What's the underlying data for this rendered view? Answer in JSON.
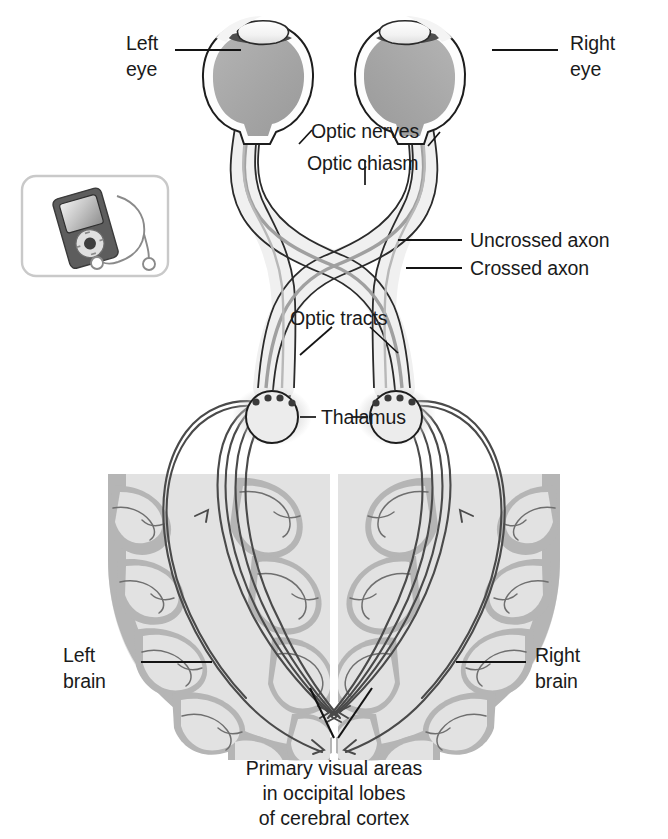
{
  "figure": {
    "background_color": "#ffffff"
  },
  "colors": {
    "outline": "#141414",
    "text": "#1a1a1a",
    "eye_interior": "#a8a8a8",
    "eye_sclera": "#fefefe",
    "nerve_fill": "#ededed",
    "nerve_core": "#bdbdbd",
    "cortex_light": "#e2e2e2",
    "cortex_gyri": "#b5b5b5",
    "thalamus_fill": "#ececec",
    "shadow": "#d6d6d6",
    "axon_line": "#4a4a4a",
    "icon_body": "#5d5d5d",
    "icon_screen": "#d8d8d8",
    "icon_box_border": "#c9c9c9"
  },
  "labels": {
    "left_eye": {
      "line1": "Left",
      "line2": "eye"
    },
    "right_eye": {
      "line1": "Right",
      "line2": "eye"
    },
    "optic_nerves": "Optic nerves",
    "optic_chiasm": "Optic chiasm",
    "uncrossed_axon": "Uncrossed axon",
    "crossed_axon": "Crossed axon",
    "optic_tracts": "Optic tracts",
    "thalamus": "Thalamus",
    "left_brain": {
      "line1": "Left",
      "line2": "brain"
    },
    "right_brain": {
      "line1": "Right",
      "line2": "brain"
    },
    "caption": {
      "line1": "Primary visual areas",
      "line2": "in occipital lobes",
      "line3": "of cerebral cortex"
    }
  },
  "inset_icon": {
    "name": "mp3-player-with-earbuds",
    "description": "portable media player icon with click wheel and earphones"
  },
  "structures": [
    {
      "id": "left-eye",
      "name": "Left eye"
    },
    {
      "id": "right-eye",
      "name": "Right eye"
    },
    {
      "id": "optic-nerve-left",
      "name": "Left optic nerve"
    },
    {
      "id": "optic-nerve-right",
      "name": "Right optic nerve"
    },
    {
      "id": "optic-chiasm",
      "name": "Optic chiasm"
    },
    {
      "id": "optic-tract-left",
      "name": "Left optic tract"
    },
    {
      "id": "optic-tract-right",
      "name": "Right optic tract"
    },
    {
      "id": "thalamus-left",
      "name": "Left thalamus (LGN)"
    },
    {
      "id": "thalamus-right",
      "name": "Right thalamus (LGN)"
    },
    {
      "id": "cortex-left",
      "name": "Left cerebral hemisphere"
    },
    {
      "id": "cortex-right",
      "name": "Right cerebral hemisphere"
    },
    {
      "id": "optic-radiations",
      "name": "Optic radiations"
    }
  ]
}
